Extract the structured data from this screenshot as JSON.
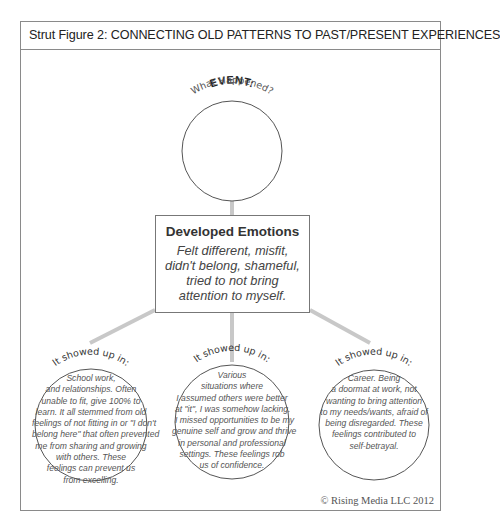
{
  "title": "Strut Figure 2: CONNECTING OLD PATTERNS TO PAST/PRESENT EXPERIENCES",
  "event": {
    "label": "EVENT:",
    "sublabel": "What Happened?"
  },
  "developed_emotions": {
    "title": "Developed Emotions",
    "lines": [
      "Felt different, misfit,",
      "didn't belong, shameful,",
      "tried to not bring",
      "attention to myself."
    ]
  },
  "showed_up": [
    {
      "label": "It showed up in:",
      "lines": [
        "School work,",
        "and relationships. Often",
        "unable to fit, give 100% to",
        "learn. It all stemmed from old",
        "feelings of not fitting in or \"I don't",
        "belong here\" that often prevented",
        "me from sharing and growing",
        "with others. These",
        "feelings can prevent us",
        "from excelling."
      ]
    },
    {
      "label": "It showed up in:",
      "lines": [
        "Various",
        "situations where",
        "I assumed others were better",
        "at \"it\", I was somehow lacking.",
        "I missed opportunities to be my",
        "genuine self and grow and thrive",
        "in personal and professional",
        "settings. These feelings rob",
        "us of confidence."
      ]
    },
    {
      "label": "It showed up in:",
      "lines": [
        "Career. Being",
        "a doormat at work, not",
        "wanting to bring attention",
        "to my needs/wants, afraid of",
        "being disregarded. These",
        "feelings contributed to",
        "self-betrayal."
      ]
    }
  ],
  "copyright": "© Rising Media LLC 2012",
  "colors": {
    "frame": "#8a8a8a",
    "connector": "#c8c8c8",
    "circle": "#555555",
    "text": "#333333"
  }
}
